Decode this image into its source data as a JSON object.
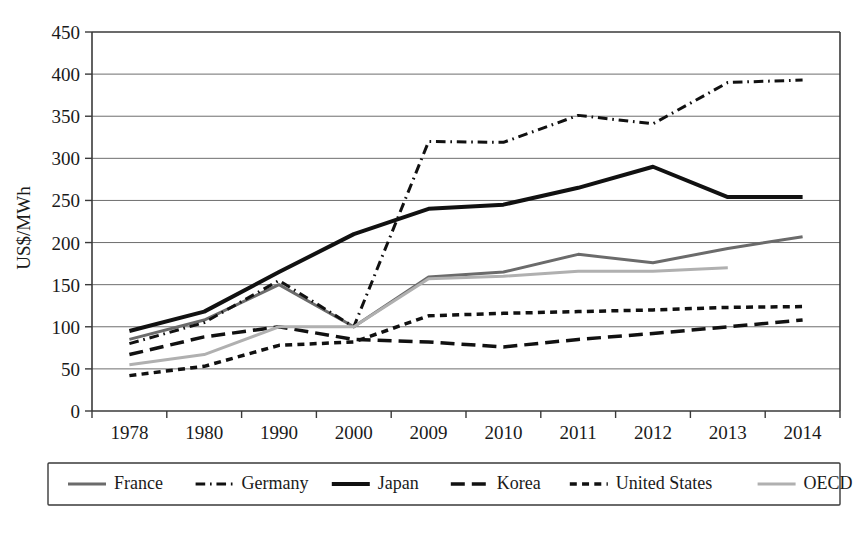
{
  "chart_data": {
    "type": "line",
    "title": "",
    "xlabel": "",
    "ylabel": "US$/MWh",
    "categories": [
      "1978",
      "1980",
      "1990",
      "2000",
      "2009",
      "2010",
      "2011",
      "2012",
      "2013",
      "2014"
    ],
    "ylim": [
      0,
      450
    ],
    "yticks": [
      0,
      50,
      100,
      150,
      200,
      250,
      300,
      350,
      400,
      450
    ],
    "grid": true,
    "legend_position": "bottom",
    "series": [
      {
        "name": "France",
        "color": "#6b6b6b",
        "style": "solid",
        "width": 3,
        "values": [
          85,
          108,
          150,
          100,
          159,
          165,
          186,
          176,
          193,
          207
        ]
      },
      {
        "name": "Germany",
        "color": "#111111",
        "style": "dashdot",
        "width": 3,
        "values": [
          80,
          105,
          155,
          100,
          320,
          319,
          351,
          341,
          390,
          393
        ]
      },
      {
        "name": "Japan",
        "color": "#111111",
        "style": "solid",
        "width": 4,
        "values": [
          95,
          118,
          165,
          210,
          240,
          245,
          265,
          290,
          254,
          254
        ]
      },
      {
        "name": "Korea",
        "color": "#111111",
        "style": "longdash",
        "width": 3.5,
        "values": [
          67,
          88,
          100,
          85,
          82,
          76,
          85,
          92,
          100,
          108
        ]
      },
      {
        "name": "United States",
        "color": "#111111",
        "style": "shortdash",
        "width": 3.5,
        "values": [
          42,
          53,
          78,
          82,
          113,
          116,
          118,
          120,
          123,
          124
        ]
      },
      {
        "name": "OECD",
        "color": "#b0b0b0",
        "style": "solid",
        "width": 3,
        "values": [
          55,
          67,
          100,
          100,
          157,
          160,
          166,
          166,
          170,
          null
        ]
      }
    ]
  },
  "legend": {
    "items": [
      {
        "label": "France"
      },
      {
        "label": "Germany"
      },
      {
        "label": "Japan"
      },
      {
        "label": "Korea"
      },
      {
        "label": "United States"
      },
      {
        "label": "OECD"
      }
    ]
  }
}
